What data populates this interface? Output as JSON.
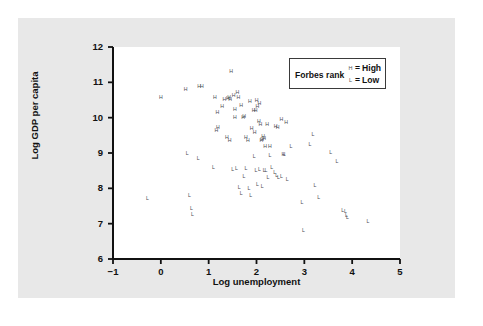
{
  "figure": {
    "background_color": "#e8e8e8",
    "plot_background_color": "#ffffff",
    "axis_color": "#111111",
    "marker_color": "#4a4a52"
  },
  "legend": {
    "title": "Forbes rank",
    "entries": [
      {
        "marker": "H",
        "equals": "=",
        "label": "High"
      },
      {
        "marker": "L",
        "equals": "=",
        "label": "Low"
      }
    ]
  },
  "chart_data": {
    "type": "scatter",
    "title": "",
    "xlabel": "Log unemployment",
    "ylabel": "Log GDP per capita",
    "xlim": [
      -1,
      5
    ],
    "ylim": [
      6,
      12
    ],
    "xticks": [
      -1,
      0,
      1,
      2,
      3,
      4,
      5
    ],
    "yticks": [
      6,
      7,
      8,
      9,
      10,
      11,
      12
    ],
    "xtick_labels": [
      "−1",
      "0",
      "1",
      "2",
      "3",
      "4",
      "5"
    ],
    "ytick_labels": [
      "6",
      "7",
      "8",
      "9",
      "10",
      "11",
      "12"
    ],
    "grid": false,
    "legend_position": "top-right",
    "series": [
      {
        "name": "High",
        "marker": "H",
        "points": [
          [
            0.0,
            10.56
          ],
          [
            0.52,
            10.79
          ],
          [
            0.8,
            10.88
          ],
          [
            0.86,
            10.88
          ],
          [
            1.13,
            10.56
          ],
          [
            1.18,
            10.13
          ],
          [
            1.16,
            9.63
          ],
          [
            1.19,
            9.7
          ],
          [
            1.28,
            10.3
          ],
          [
            1.33,
            10.5
          ],
          [
            1.4,
            10.53
          ],
          [
            1.43,
            10.55
          ],
          [
            1.45,
            10.5
          ],
          [
            1.47,
            11.3
          ],
          [
            1.44,
            9.33
          ],
          [
            1.38,
            9.42
          ],
          [
            1.55,
            10.22
          ],
          [
            1.6,
            10.7
          ],
          [
            1.62,
            10.56
          ],
          [
            1.72,
            9.98
          ],
          [
            1.74,
            10.03
          ],
          [
            1.78,
            9.43
          ],
          [
            1.82,
            9.35
          ],
          [
            1.86,
            10.45
          ],
          [
            1.9,
            9.68
          ],
          [
            1.94,
            10.19
          ],
          [
            1.96,
            9.56
          ],
          [
            1.98,
            10.18
          ],
          [
            2.0,
            10.47
          ],
          [
            2.02,
            10.3
          ],
          [
            2.05,
            9.88
          ],
          [
            2.06,
            10.4
          ],
          [
            2.08,
            9.8
          ],
          [
            2.1,
            9.33
          ],
          [
            2.12,
            9.36
          ],
          [
            2.14,
            9.45
          ],
          [
            2.16,
            9.4
          ],
          [
            2.18,
            9.18
          ],
          [
            2.22,
            9.8
          ],
          [
            2.28,
            9.17
          ],
          [
            2.4,
            9.73
          ],
          [
            2.44,
            9.72
          ],
          [
            2.52,
            9.92
          ],
          [
            2.56,
            8.93
          ],
          [
            2.62,
            9.85
          ],
          [
            1.55,
            9.98
          ],
          [
            1.68,
            10.33
          ],
          [
            1.52,
            10.6
          ]
        ]
      },
      {
        "name": "Low",
        "marker": "L",
        "points": [
          [
            -0.28,
            7.69
          ],
          [
            0.55,
            8.98
          ],
          [
            0.78,
            8.82
          ],
          [
            0.6,
            7.77
          ],
          [
            0.64,
            7.42
          ],
          [
            0.66,
            7.24
          ],
          [
            1.1,
            8.58
          ],
          [
            1.5,
            8.53
          ],
          [
            1.58,
            8.55
          ],
          [
            1.64,
            8.02
          ],
          [
            1.68,
            7.83
          ],
          [
            1.74,
            8.32
          ],
          [
            1.78,
            8.55
          ],
          [
            1.84,
            7.98
          ],
          [
            1.88,
            7.78
          ],
          [
            1.95,
            8.88
          ],
          [
            1.99,
            8.48
          ],
          [
            2.02,
            8.1
          ],
          [
            2.06,
            8.52
          ],
          [
            2.12,
            8.03
          ],
          [
            2.16,
            8.5
          ],
          [
            2.2,
            8.48
          ],
          [
            2.24,
            8.3
          ],
          [
            2.28,
            8.92
          ],
          [
            2.32,
            8.58
          ],
          [
            2.38,
            8.42
          ],
          [
            2.42,
            8.35
          ],
          [
            2.46,
            8.28
          ],
          [
            2.52,
            8.32
          ],
          [
            2.58,
            8.95
          ],
          [
            2.64,
            8.25
          ],
          [
            2.72,
            9.18
          ],
          [
            2.95,
            7.58
          ],
          [
            2.98,
            6.78
          ],
          [
            3.12,
            9.23
          ],
          [
            3.18,
            9.52
          ],
          [
            3.22,
            8.08
          ],
          [
            3.3,
            7.72
          ],
          [
            3.55,
            9.0
          ],
          [
            3.68,
            8.75
          ],
          [
            3.8,
            7.36
          ],
          [
            3.86,
            7.33
          ],
          [
            3.88,
            7.22
          ],
          [
            3.9,
            7.16
          ],
          [
            4.33,
            7.05
          ]
        ]
      }
    ]
  }
}
